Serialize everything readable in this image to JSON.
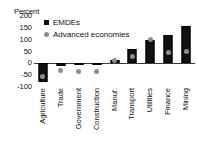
{
  "chart_data": {
    "type": "bar",
    "title": "",
    "subtitle": "",
    "unit_label": "Percent",
    "xlabel": "",
    "ylabel": "Percent",
    "ylim": [
      -100,
      200
    ],
    "yticks": [
      200,
      150,
      100,
      50,
      0,
      -50,
      -100
    ],
    "ytick_labels": [
      "200",
      "150",
      "100",
      "50",
      "0",
      "-50",
      "-100"
    ],
    "grid": false,
    "legend_position": "top-left-inside",
    "categories": [
      "Agriculture",
      "Trade",
      "Government",
      "Construction",
      "Manuf.",
      "Transport",
      "Utilities",
      "Finance",
      "Mining"
    ],
    "series": [
      {
        "name": "EMDEs",
        "marker": "square",
        "color": "#111111",
        "values": [
          -80,
          -10,
          -5,
          -4,
          15,
          60,
          100,
          120,
          158
        ]
      },
      {
        "name": "Advanced economies",
        "marker": "circle",
        "color": "#8d8d8d",
        "values": [
          -55,
          -32,
          -34,
          -33,
          10,
          28,
          100,
          45,
          50
        ]
      }
    ]
  },
  "legend": {
    "items": [
      {
        "label": "EMDEs",
        "swatch": "square-marker-icon"
      },
      {
        "label": "Advanced economies",
        "swatch": "circle-marker-icon"
      }
    ]
  }
}
